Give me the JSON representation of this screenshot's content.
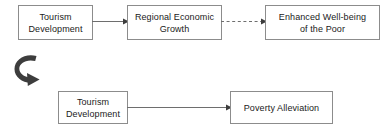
{
  "diagram": {
    "background_color": "#ffffff",
    "box_border_color": "#8c8c8c",
    "text_color": "#1a1a1a",
    "connector_color": "#6e6e6e",
    "rotation_arrow_color": "#3d3d3d",
    "top_row": {
      "nodes": [
        {
          "id": "tourism-development-top",
          "label": "Tourism\nDevelopment"
        },
        {
          "id": "regional-economic-growth",
          "label": "Regional Economic\nGrowth"
        },
        {
          "id": "enhanced-wellbeing",
          "label": "Enhanced Well-being\nof the Poor"
        }
      ],
      "connectors": [
        {
          "id": "solid-top",
          "from": "tourism-development-top",
          "to": "regional-economic-growth",
          "style": "solid",
          "arrowhead": "filled"
        },
        {
          "id": "dashed-top",
          "from": "regional-economic-growth",
          "to": "enhanced-wellbeing",
          "style": "dashed",
          "arrowhead": "filled"
        }
      ]
    },
    "transition": {
      "id": "rotation-arrow",
      "icon": "curved-rotation-arrow",
      "description": "Curved rotational arrow"
    },
    "bottom_row": {
      "nodes": [
        {
          "id": "tourism-development-bottom",
          "label": "Tourism\nDevelopment"
        },
        {
          "id": "poverty-alleviation",
          "label": "Poverty Alleviation"
        }
      ],
      "connectors": [
        {
          "id": "solid-bottom",
          "from": "tourism-development-bottom",
          "to": "poverty-alleviation",
          "style": "solid",
          "arrowhead": "filled"
        }
      ]
    }
  }
}
